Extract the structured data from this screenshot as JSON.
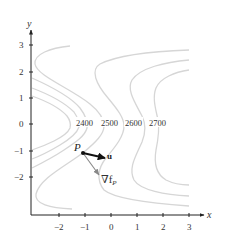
{
  "figure": {
    "axes": {
      "x_label": "x",
      "y_label": "y",
      "x_ticks": [
        "−2",
        "−1",
        "0",
        "1",
        "2",
        "3"
      ],
      "y_ticks": [
        "3",
        "2",
        "1",
        "0",
        "−1",
        "−2"
      ],
      "x_range": [
        -3.0,
        3.5
      ],
      "y_range": [
        -3.4,
        3.6
      ]
    },
    "contour_labels": [
      "2400",
      "2500",
      "2600",
      "2700"
    ],
    "point": {
      "label": "P",
      "x": -1.05,
      "y": -1.1
    },
    "vectors": {
      "u": {
        "label": "u",
        "from": [
          -1.05,
          -1.1
        ],
        "to": [
          -0.2,
          -1.3
        ]
      },
      "gradient": {
        "label": "∇f",
        "subscript": "P",
        "from": [
          -1.05,
          -1.1
        ],
        "to": [
          -0.45,
          -1.9
        ]
      }
    },
    "colors": {
      "contour": "#d6d6d6",
      "axis": "#222222",
      "u_vector": "#111111",
      "gradient_vector": "#888888"
    }
  }
}
